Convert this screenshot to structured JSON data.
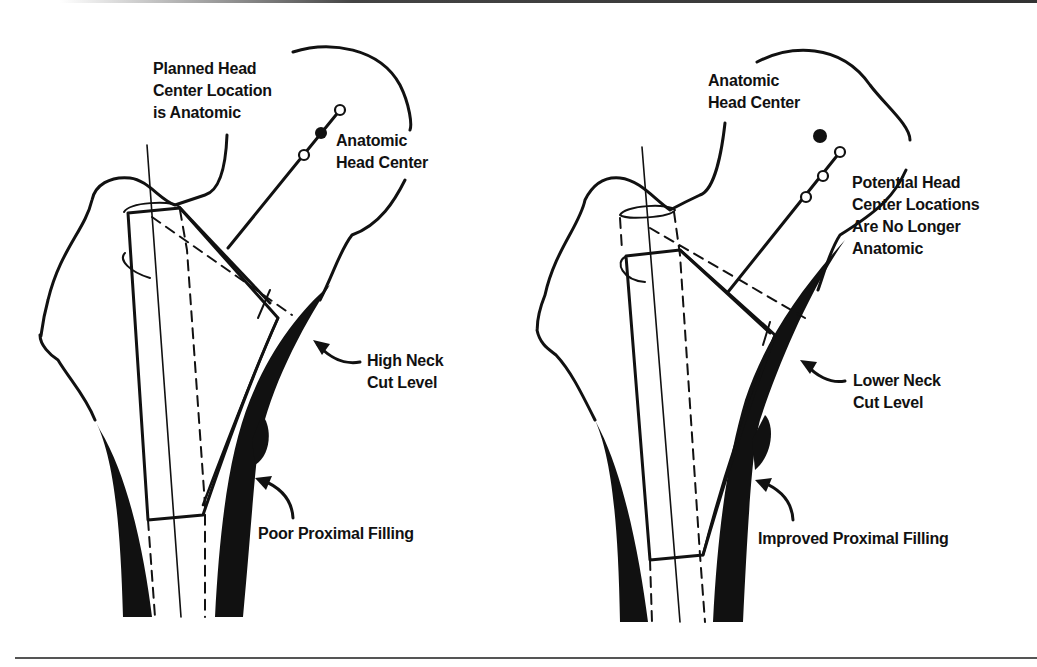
{
  "figure": {
    "panels": [
      {
        "id": "left",
        "title_hidden": "High neck cut",
        "labels": {
          "planned_head": [
            "Planned Head",
            "Center Location",
            "is Anatomic"
          ],
          "anatomic_head": [
            "Anatomic",
            "Head Center"
          ],
          "neck_cut": [
            "High Neck",
            "Cut Level"
          ],
          "filling": "Poor Proximal Filling"
        }
      },
      {
        "id": "right",
        "labels": {
          "anatomic_head": [
            "Anatomic",
            "Head Center"
          ],
          "potential_head": [
            "Potential Head",
            "Center Locations",
            "Are No Longer",
            "Anatomic"
          ],
          "neck_cut": [
            "Lower Neck",
            "Cut Level"
          ],
          "filling": "Improved Proximal Filling"
        }
      }
    ],
    "colors": {
      "ink": "#111111",
      "paper": "#ffffff"
    }
  }
}
